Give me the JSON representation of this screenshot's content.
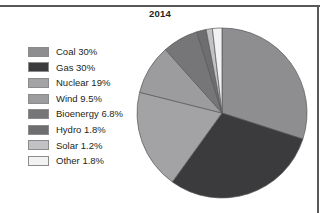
{
  "figure": {
    "width": 328,
    "height": 213,
    "background": "#ffffff",
    "frame_color": "#58585a"
  },
  "title": "2014",
  "legend": {
    "items": [
      {
        "label": "Coal 30%",
        "color": "#8e8e90"
      },
      {
        "label": "Gas 30%",
        "color": "#3b3b3d"
      },
      {
        "label": "Nuclear 19%",
        "color": "#a3a3a5"
      },
      {
        "label": "Wind 9.5%",
        "color": "#9c9c9e"
      },
      {
        "label": "Bioenergy 6.8%",
        "color": "#767678"
      },
      {
        "label": "Hydro 1.8%",
        "color": "#6e6e70"
      },
      {
        "label": "Solar 1.2%",
        "color": "#c2c2c4"
      },
      {
        "label": "Other 1.8%",
        "color": "#f2f2f2"
      }
    ]
  },
  "pie": {
    "center_x": 86,
    "center_y": 86,
    "radius": 85,
    "start_angle_deg": -90,
    "direction": "clockwise",
    "stroke": "#58585a",
    "stroke_width": 0.7
  },
  "chart_data": {
    "type": "pie",
    "title": "2014",
    "xlabel": "",
    "ylabel": "",
    "legend_position": "left",
    "grid": false,
    "categories": [
      "Coal",
      "Gas",
      "Nuclear",
      "Wind",
      "Bioenergy",
      "Hydro",
      "Solar",
      "Other"
    ],
    "values": [
      30,
      30,
      19,
      9.5,
      6.8,
      1.8,
      1.2,
      1.8
    ],
    "value_unit": "%",
    "labels": [
      "Coal 30%",
      "Gas 30%",
      "Nuclear 19%",
      "Wind 9.5%",
      "Bioenergy 6.8%",
      "Hydro 1.8%",
      "Solar 1.2%",
      "Other 1.8%"
    ],
    "colors": [
      "#8e8e90",
      "#3b3b3d",
      "#a3a3a5",
      "#9c9c9e",
      "#767678",
      "#6e6e70",
      "#c2c2c4",
      "#f2f2f2"
    ]
  }
}
